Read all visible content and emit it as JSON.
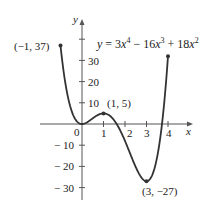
{
  "chart_data": {
    "type": "line",
    "xlabel": "x",
    "ylabel": "y",
    "xlim": [
      -1,
      4
    ],
    "ylim": [
      -35,
      40
    ],
    "grid": false,
    "x_ticks": [
      0,
      1,
      2,
      3,
      4
    ],
    "y_ticks": [
      -30,
      -20,
      -10,
      10,
      20,
      30
    ],
    "series": [
      {
        "name": "y = 3x^4 - 16x^3 + 18x^2",
        "x": [
          -1,
          -0.5,
          0,
          0.5,
          1,
          1.5,
          2,
          2.5,
          3,
          3.5,
          4
        ],
        "y": [
          37,
          6.7,
          0,
          2.7,
          5,
          -0.8,
          -8,
          -18.3,
          -27,
          -20.4,
          32
        ]
      }
    ],
    "annotations": [
      {
        "text": "(−1, 37)",
        "x": -1,
        "y": 37
      },
      {
        "text": "(1, 5)",
        "x": 1,
        "y": 5
      },
      {
        "text": "(3, −27)",
        "x": 3,
        "y": -27
      }
    ]
  },
  "labels": {
    "y_axis": "y",
    "x_axis": "x",
    "origin": "0",
    "xt1": "1",
    "xt2": "2",
    "xt3": "3",
    "xt4": "4",
    "yt30": "30",
    "yt20": "20",
    "yt10": "10",
    "ytm10": "− 10",
    "ytm20": "− 20",
    "ytm30": "− 30",
    "pt_left": "(−1, 37)",
    "pt_max": "(1, 5)",
    "pt_min": "(3, −27)",
    "eq_y": "y",
    "eq_eq": " = 3",
    "eq_x1": "x",
    "eq_p1": "4",
    "eq_m": " − 16",
    "eq_x2": "x",
    "eq_p2": "3",
    "eq_plus": " + 18",
    "eq_x3": "x",
    "eq_p3": "2"
  }
}
